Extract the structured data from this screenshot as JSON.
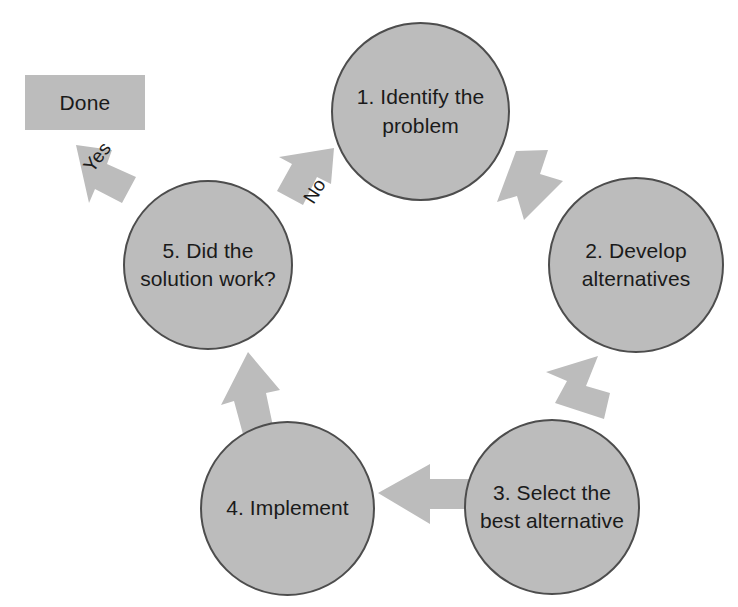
{
  "diagram": {
    "colors": {
      "node_fill": "#bcbcbc",
      "node_stroke": "#4d4d4d",
      "arrow_fill": "#bcbcbc",
      "text": "#1a1a1a",
      "background": "#ffffff"
    },
    "terminal": {
      "label": "Done"
    },
    "nodes": [
      {
        "id": "step1",
        "label": "1. Identify the\nproblem"
      },
      {
        "id": "step2",
        "label": "2. Develop\nalternatives"
      },
      {
        "id": "step3",
        "label": "3. Select the\nbest alternative"
      },
      {
        "id": "step4",
        "label": "4. Implement"
      },
      {
        "id": "step5",
        "label": "5. Did the\nsolution work?"
      }
    ],
    "edges": [
      {
        "id": "e1",
        "from": "step1",
        "to": "step2",
        "label": ""
      },
      {
        "id": "e2",
        "from": "step2",
        "to": "step3",
        "label": ""
      },
      {
        "id": "e3",
        "from": "step3",
        "to": "step4",
        "label": ""
      },
      {
        "id": "e4",
        "from": "step4",
        "to": "step5",
        "label": ""
      },
      {
        "id": "e5",
        "from": "step5",
        "to": "step1",
        "label": "No"
      },
      {
        "id": "e6",
        "from": "step5",
        "to": "terminal",
        "label": "Yes"
      }
    ]
  }
}
